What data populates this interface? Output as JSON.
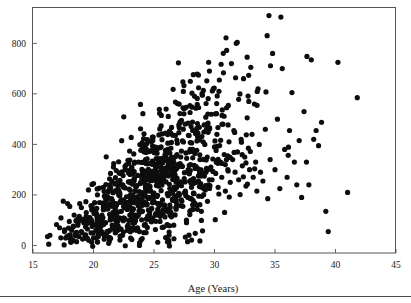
{
  "chart_data": {
    "type": "scatter",
    "title": "",
    "subtitle": "",
    "xlabel": "Age (Years)",
    "ylabel": "",
    "xlim": [
      15,
      45
    ],
    "ylim": [
      -30,
      940
    ],
    "xticks": [
      15,
      20,
      25,
      30,
      35,
      40,
      45
    ],
    "xtick_labels": [
      "15",
      "20",
      "25",
      "30",
      "35",
      "40",
      "45"
    ],
    "yticks": [
      0,
      200,
      400,
      600,
      800
    ],
    "ytick_labels": [
      "0",
      "200",
      "400",
      "600",
      "800"
    ],
    "grid": false,
    "legend": null,
    "marker": "filled-circle",
    "marker_color": "#0d0d0d",
    "marker_size": 2.6,
    "n_points": 1000,
    "annotations": [],
    "series": [
      {
        "name": "observations",
        "points": [
          [
            16.2,
            35
          ],
          [
            16.3,
            5
          ],
          [
            16.4,
            40
          ],
          [
            17.2,
            70
          ],
          [
            17.3,
            30
          ],
          [
            17.5,
            175
          ],
          [
            17.6,
            55
          ],
          [
            17.8,
            35
          ],
          [
            18.0,
            95
          ],
          [
            18.1,
            30
          ],
          [
            18.2,
            60
          ],
          [
            18.3,
            20
          ],
          [
            18.4,
            120
          ],
          [
            18.5,
            45
          ],
          [
            18.6,
            15
          ],
          [
            18.7,
            80
          ],
          [
            18.8,
            35
          ],
          [
            18.9,
            100
          ],
          [
            19.0,
            55
          ],
          [
            19.0,
            150
          ],
          [
            19.1,
            25
          ],
          [
            19.2,
            90
          ],
          [
            19.3,
            40
          ],
          [
            19.4,
            130
          ],
          [
            19.5,
            65
          ],
          [
            19.6,
            20
          ],
          [
            19.7,
            110
          ],
          [
            19.8,
            50
          ],
          [
            19.9,
            85
          ],
          [
            20.0,
            30
          ],
          [
            20.0,
            245
          ],
          [
            20.1,
            140
          ],
          [
            20.2,
            60
          ],
          [
            20.3,
            100
          ],
          [
            20.4,
            35
          ],
          [
            20.5,
            170
          ],
          [
            20.6,
            75
          ],
          [
            20.7,
            120
          ],
          [
            20.8,
            45
          ],
          [
            20.9,
            195
          ],
          [
            21.0,
            90
          ],
          [
            21.1,
            55
          ],
          [
            21.2,
            145
          ],
          [
            21.3,
            30
          ],
          [
            21.4,
            110
          ],
          [
            21.5,
            185
          ],
          [
            21.6,
            70
          ],
          [
            21.7,
            125
          ],
          [
            21.8,
            50
          ],
          [
            21.9,
            160
          ],
          [
            22.0,
            95
          ],
          [
            22.1,
            215
          ],
          [
            22.2,
            65
          ],
          [
            22.3,
            135
          ],
          [
            22.4,
            40
          ],
          [
            22.5,
            180
          ],
          [
            22.6,
            105
          ],
          [
            22.7,
            155
          ],
          [
            22.8,
            75
          ],
          [
            22.9,
            325
          ],
          [
            23.0,
            120
          ],
          [
            23.1,
            200
          ],
          [
            23.2,
            60
          ],
          [
            23.3,
            145
          ],
          [
            23.4,
            90
          ],
          [
            23.5,
            230
          ],
          [
            23.6,
            115
          ],
          [
            23.7,
            170
          ],
          [
            23.8,
            55
          ],
          [
            23.9,
            250
          ],
          [
            24.0,
            135
          ],
          [
            24.1,
            195
          ],
          [
            24.2,
            80
          ],
          [
            24.3,
            340
          ],
          [
            24.4,
            160
          ],
          [
            24.5,
            215
          ],
          [
            24.6,
            105
          ],
          [
            24.7,
            265
          ],
          [
            24.8,
            145
          ],
          [
            24.9,
            415
          ],
          [
            25.0,
            190
          ],
          [
            25.1,
            120
          ],
          [
            25.2,
            290
          ],
          [
            25.3,
            165
          ],
          [
            25.4,
            235
          ],
          [
            25.5,
            95
          ],
          [
            25.6,
            310
          ],
          [
            25.7,
            180
          ],
          [
            25.8,
            255
          ],
          [
            25.9,
            140
          ],
          [
            26.0,
            540
          ],
          [
            26.1,
            205
          ],
          [
            26.2,
            275
          ],
          [
            26.3,
            160
          ],
          [
            26.4,
            330
          ],
          [
            26.5,
            220
          ],
          [
            26.6,
            185
          ],
          [
            26.7,
            295
          ],
          [
            26.8,
            150
          ],
          [
            26.9,
            360
          ],
          [
            27.0,
            240
          ],
          [
            27.1,
            200
          ],
          [
            27.2,
            315
          ],
          [
            27.3,
            175
          ],
          [
            27.4,
            545
          ],
          [
            27.5,
            265
          ],
          [
            27.6,
            210
          ],
          [
            27.7,
            345
          ],
          [
            27.8,
            190
          ],
          [
            27.9,
            285
          ],
          [
            28.0,
            650
          ],
          [
            28.1,
            230
          ],
          [
            28.2,
            380
          ],
          [
            28.3,
            205
          ],
          [
            28.4,
            305
          ],
          [
            28.5,
            250
          ],
          [
            28.6,
            430
          ],
          [
            28.7,
            195
          ],
          [
            28.8,
            340
          ],
          [
            28.9,
            275
          ],
          [
            29.0,
            595
          ],
          [
            29.1,
            225
          ],
          [
            29.2,
            400
          ],
          [
            29.3,
            290
          ],
          [
            29.4,
            350
          ],
          [
            29.5,
            240
          ],
          [
            29.6,
            465
          ],
          [
            29.7,
            310
          ],
          [
            29.8,
            260
          ],
          [
            29.9,
            620
          ],
          [
            30.0,
            390
          ],
          [
            30.1,
            285
          ],
          [
            30.2,
            440
          ],
          [
            30.3,
            230
          ],
          [
            30.4,
            655
          ],
          [
            30.5,
            330
          ],
          [
            30.6,
            270
          ],
          [
            30.7,
            480
          ],
          [
            30.8,
            360
          ],
          [
            30.9,
            215
          ],
          [
            31.0,
            545
          ],
          [
            31.1,
            300
          ],
          [
            31.2,
            410
          ],
          [
            31.3,
            250
          ],
          [
            31.4,
            720
          ],
          [
            31.5,
            340
          ],
          [
            31.6,
            455
          ],
          [
            31.7,
            290
          ],
          [
            31.8,
            800
          ],
          [
            31.9,
            370
          ],
          [
            32.0,
            260
          ],
          [
            32.1,
            600
          ],
          [
            32.2,
            420
          ],
          [
            32.3,
            315
          ],
          [
            32.4,
            660
          ],
          [
            32.5,
            350
          ],
          [
            32.6,
            235
          ],
          [
            32.7,
            505
          ],
          [
            32.8,
            385
          ],
          [
            32.9,
            300
          ],
          [
            33.0,
            705
          ],
          [
            33.1,
            440
          ],
          [
            33.2,
            270
          ],
          [
            33.3,
            560
          ],
          [
            33.4,
            330
          ],
          [
            33.5,
            215
          ],
          [
            33.6,
            620
          ],
          [
            33.7,
            400
          ],
          [
            33.8,
            290
          ],
          [
            34.0,
            255
          ],
          [
            34.2,
            460
          ],
          [
            34.4,
            185
          ],
          [
            34.5,
            910
          ],
          [
            34.6,
            340
          ],
          [
            34.8,
            760
          ],
          [
            35.0,
            300
          ],
          [
            35.2,
            500
          ],
          [
            35.4,
            225
          ],
          [
            35.6,
            700
          ],
          [
            35.8,
            380
          ],
          [
            36.0,
            270
          ],
          [
            36.2,
            455
          ],
          [
            36.4,
            605
          ],
          [
            36.6,
            330
          ],
          [
            36.8,
            240
          ],
          [
            37.0,
            415
          ],
          [
            37.2,
            190
          ],
          [
            37.4,
            530
          ],
          [
            37.6,
            330
          ],
          [
            37.8,
            240
          ],
          [
            38.0,
            735
          ],
          [
            38.2,
            420
          ],
          [
            38.4,
            455
          ],
          [
            38.6,
            395
          ],
          [
            39.2,
            135
          ],
          [
            39.4,
            55
          ],
          [
            40.2,
            725
          ],
          [
            41.0,
            210
          ],
          [
            41.8,
            585
          ]
        ]
      }
    ]
  },
  "axes": {
    "x_axis_name": "x-axis",
    "y_axis_name": "y-axis",
    "frame_color": "#555555"
  },
  "footer": {
    "rule_present": true
  }
}
